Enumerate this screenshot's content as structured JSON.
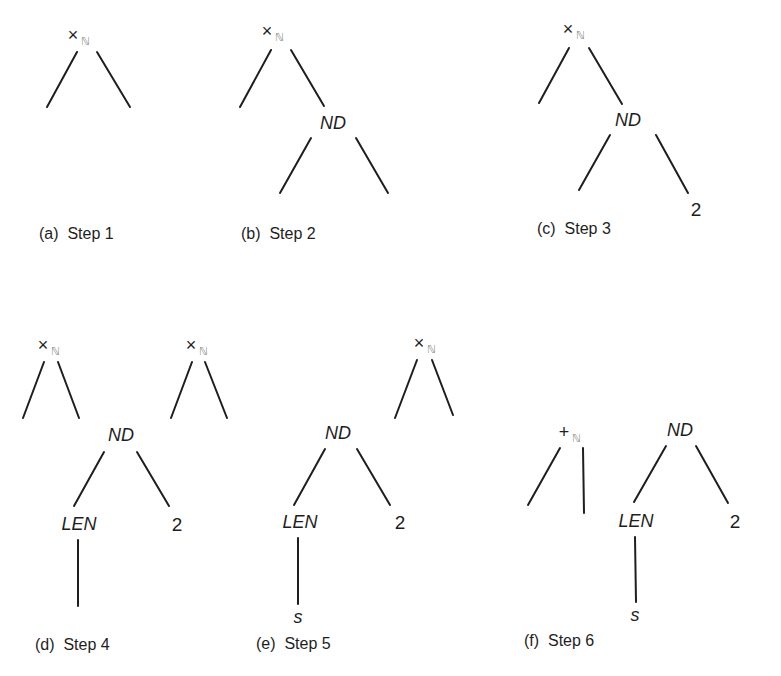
{
  "figure": {
    "panels": [
      {
        "id": "a",
        "caption": "(a)  Step 1",
        "nodes": [
          {
            "label": "×",
            "sub": "ℕ",
            "kind": "op",
            "x": 79,
            "y": 35
          }
        ],
        "edges": [
          [
            77,
            52,
            47,
            107
          ],
          [
            97,
            52,
            130,
            107
          ]
        ],
        "caption_pos": [
          39,
          226
        ]
      },
      {
        "id": "b",
        "caption": "(b)  Step 2",
        "nodes": [
          {
            "label": "×",
            "sub": "ℕ",
            "kind": "op",
            "x": 273,
            "y": 31
          },
          {
            "label": "ND",
            "kind": "it",
            "x": 333,
            "y": 123
          }
        ],
        "edges": [
          [
            271,
            50,
            240,
            107
          ],
          [
            291,
            50,
            324,
            106
          ],
          [
            311,
            138,
            280,
            193
          ],
          [
            356,
            138,
            388,
            193
          ]
        ],
        "caption_pos": [
          241,
          226
        ]
      },
      {
        "id": "c",
        "caption": "(c)  Step 3",
        "nodes": [
          {
            "label": "×",
            "sub": "ℕ",
            "kind": "op",
            "x": 574,
            "y": 29
          },
          {
            "label": "ND",
            "kind": "it",
            "x": 628,
            "y": 120
          },
          {
            "label": "2",
            "kind": "num",
            "x": 696,
            "y": 209
          }
        ],
        "edges": [
          [
            569,
            48,
            539,
            103
          ],
          [
            589,
            48,
            622,
            104
          ],
          [
            610,
            135,
            579,
            190
          ],
          [
            656,
            135,
            688,
            193
          ]
        ],
        "caption_pos": [
          537,
          221
        ]
      },
      {
        "id": "d",
        "caption": "(d)  Step 4",
        "nodes": [
          {
            "label": "×",
            "sub": "ℕ",
            "kind": "op",
            "x": 49,
            "y": 345
          },
          {
            "label": "ND",
            "kind": "it",
            "x": 121,
            "y": 435
          },
          {
            "label": "LEN",
            "kind": "it",
            "x": 79,
            "y": 524
          },
          {
            "label": "2",
            "kind": "num",
            "x": 177,
            "y": 524
          }
        ],
        "edges": [
          [
            44,
            362,
            23,
            418
          ],
          [
            58,
            362,
            79,
            418
          ],
          [
            104,
            452,
            74,
            506
          ],
          [
            137,
            452,
            169,
            506
          ],
          [
            78,
            540,
            78,
            606
          ]
        ],
        "caption_pos": [
          35,
          637
        ]
      },
      {
        "id": "e",
        "caption": "(e)  Step 5",
        "nodes": [
          {
            "label": "×",
            "sub": "ℕ",
            "kind": "op",
            "x": 197,
            "y": 345
          },
          {
            "label": "ND",
            "kind": "it",
            "x": 338,
            "y": 433
          },
          {
            "label": "LEN",
            "kind": "it",
            "x": 300,
            "y": 522
          },
          {
            "label": "2",
            "kind": "num",
            "x": 400,
            "y": 522
          },
          {
            "label": "s",
            "kind": "it",
            "x": 298,
            "y": 617
          }
        ],
        "edges": [
          [
            192,
            362,
            171,
            418
          ],
          [
            205,
            362,
            227,
            418
          ],
          [
            325,
            449,
            294,
            505
          ],
          [
            357,
            449,
            390,
            505
          ],
          [
            298,
            538,
            298,
            604
          ]
        ],
        "caption_pos": [
          256,
          636
        ]
      },
      {
        "id": "f",
        "caption": "(f)  Step 6",
        "nodes": [
          {
            "label": "×",
            "sub": "ℕ",
            "kind": "op",
            "x": 425,
            "y": 343
          },
          {
            "label": "+",
            "sub": "ℕ",
            "kind": "op",
            "x": 570,
            "y": 432
          },
          {
            "label": "ND",
            "kind": "it",
            "x": 680,
            "y": 430
          },
          {
            "label": "LEN",
            "kind": "it",
            "x": 636,
            "y": 521
          },
          {
            "label": "2",
            "kind": "num",
            "x": 735,
            "y": 521
          },
          {
            "label": "s",
            "kind": "it",
            "x": 635,
            "y": 615
          }
        ],
        "edges": [
          [
            417,
            360,
            395,
            418
          ],
          [
            432,
            360,
            453,
            415
          ],
          [
            560,
            448,
            528,
            505
          ],
          [
            583,
            448,
            584,
            513
          ],
          [
            666,
            446,
            634,
            502
          ],
          [
            696,
            446,
            728,
            503
          ],
          [
            635,
            537,
            636,
            602
          ]
        ],
        "caption_pos": [
          524,
          633
        ]
      }
    ]
  }
}
